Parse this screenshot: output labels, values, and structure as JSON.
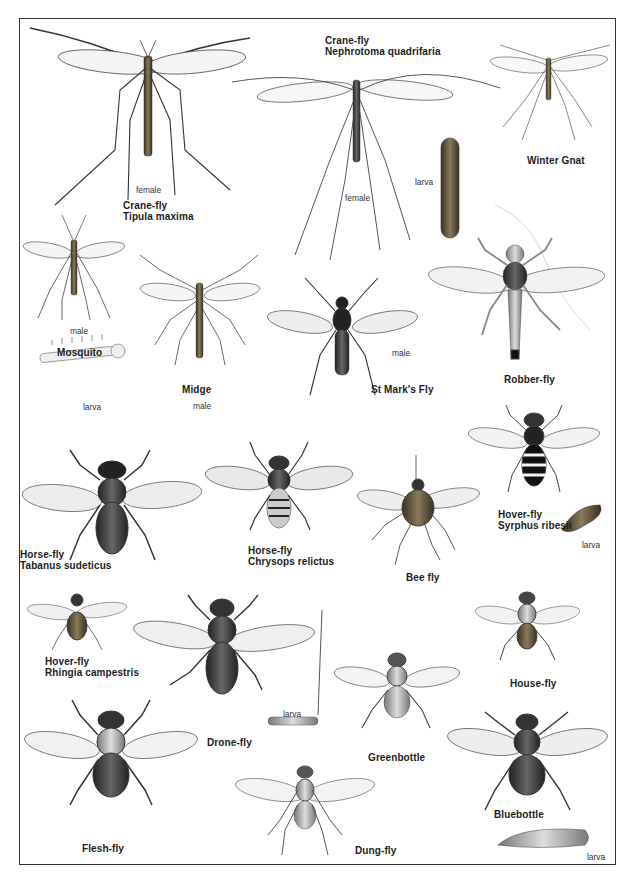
{
  "plate": {
    "border_color": "#333333",
    "background": "#ffffff"
  },
  "species": [
    {
      "id": "crane-fly-tipula",
      "common": "Crane-fly",
      "latin": "Tipula maxima",
      "note": "female"
    },
    {
      "id": "crane-fly-nephrotoma",
      "common": "Crane-fly",
      "latin": "Nephrotoma quadrifaria",
      "note": "female",
      "larva": "larva"
    },
    {
      "id": "winter-gnat",
      "common": "Winter Gnat"
    },
    {
      "id": "mosquito",
      "common": "Mosquito",
      "note": "male",
      "larva": "larva"
    },
    {
      "id": "midge",
      "common": "Midge",
      "note": "male"
    },
    {
      "id": "st-marks-fly",
      "common": "St Mark's Fly",
      "note": "male"
    },
    {
      "id": "robber-fly",
      "common": "Robber-fly"
    },
    {
      "id": "horse-fly-tabanus",
      "common": "Horse-fly",
      "latin": "Tabanus sudeticus"
    },
    {
      "id": "horse-fly-chrysops",
      "common": "Horse-fly",
      "latin": "Chrysops relictus"
    },
    {
      "id": "bee-fly",
      "common": "Bee fly"
    },
    {
      "id": "hover-fly-syrphus",
      "common": "Hover-fly",
      "latin": "Syrphus ribesii",
      "larva": "larva"
    },
    {
      "id": "hover-fly-rhingia",
      "common": "Hover-fly",
      "latin": "Rhingia campestris"
    },
    {
      "id": "drone-fly",
      "common": "Drone-fly",
      "larva": "larva"
    },
    {
      "id": "greenbottle",
      "common": "Greenbottle"
    },
    {
      "id": "house-fly",
      "common": "House-fly"
    },
    {
      "id": "flesh-fly",
      "common": "Flesh-fly"
    },
    {
      "id": "dung-fly",
      "common": "Dung-fly"
    },
    {
      "id": "bluebottle",
      "common": "Bluebottle",
      "larva": "larva"
    }
  ]
}
